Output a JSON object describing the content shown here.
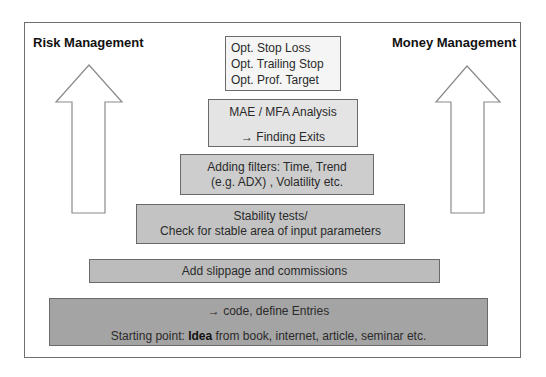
{
  "diagram": {
    "left_label": "Risk Management",
    "right_label": "Money Management",
    "colors": {
      "frame_border": "#6e6e6e",
      "box_border": "#6a6a6a",
      "arrow_stroke": "#8a8a8a",
      "level6_fill": "#f5f5f5",
      "level5_fill": "#e4e4e4",
      "level4_fill": "#cdcdcd",
      "level3_fill": "#c3c3c3",
      "level2_fill": "#bcbcbc",
      "level1_fill": "#a4a4a4"
    },
    "levels": [
      {
        "id": "optimization",
        "lines": [
          "Opt. Stop Loss",
          "Opt. Trailing Stop",
          "Opt. Prof. Target"
        ]
      },
      {
        "id": "mae-mfa",
        "lines": [
          "MAE / MFA Analysis",
          "→ Finding Exits"
        ]
      },
      {
        "id": "filters",
        "lines": [
          "Adding filters: Time, Trend",
          "(e.g. ADX) , Volatility etc."
        ]
      },
      {
        "id": "stability",
        "lines": [
          "Stability tests/",
          "Check for stable area of input parameters"
        ]
      },
      {
        "id": "slippage",
        "lines": [
          "Add slippage and commissions"
        ]
      },
      {
        "id": "idea",
        "line1": "→ code, define Entries",
        "line2_prefix": "Starting point: ",
        "line2_bold": "Idea",
        "line2_suffix": " from book, internet, article, seminar etc."
      }
    ]
  }
}
